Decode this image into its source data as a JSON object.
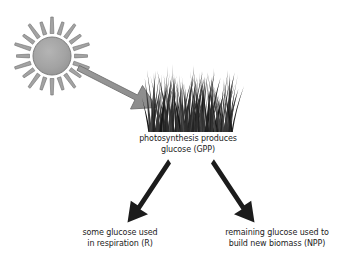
{
  "diagram": {
    "background_color": "#ffffff",
    "nodes": {
      "sun": {
        "icon": "sun-icon",
        "label": "",
        "fill_color": "#a3a3a3",
        "stroke_color": "#6e6e6e",
        "ray_count": 20,
        "center_x": 52,
        "center_y": 56,
        "radius": 19
      },
      "grass": {
        "icon": "grass-icon",
        "label": "",
        "color": "#2b2b2b",
        "blade_count": 120,
        "left": 150,
        "right": 232,
        "base_y": 132,
        "top_y": 72
      }
    },
    "captions": {
      "gpp": {
        "line1": "photosynthesis produces",
        "line2": "glucose (GPP)"
      },
      "respiration": {
        "line1": "some glucose used",
        "line2": "in respiration (R)"
      },
      "npp": {
        "line1": "remaining glucose used to",
        "line2": "build new biomass (NPP)"
      }
    },
    "arrows": [
      {
        "name": "sunlight-arrow",
        "from": "sun",
        "to": "grass",
        "color": "#8c8c8c",
        "stroke_color": "#6e6e6e",
        "x1": 80,
        "y1": 70,
        "x2": 152,
        "y2": 107
      },
      {
        "name": "respiration-arrow",
        "from": "gpp",
        "to": "respiration",
        "color": "#1c1c1c",
        "x1": 168,
        "y1": 166,
        "x2": 134,
        "y2": 220
      },
      {
        "name": "npp-arrow",
        "from": "gpp",
        "to": "npp",
        "color": "#1c1c1c",
        "x1": 214,
        "y1": 166,
        "x2": 248,
        "y2": 220
      }
    ],
    "text_color": "#1c1c1c"
  }
}
